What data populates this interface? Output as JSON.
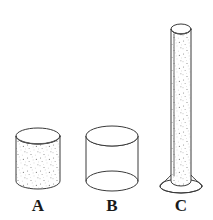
{
  "figure": {
    "background_color": "#ffffff",
    "line_color": "#3a3a3a",
    "label_color": "#1a1a1a",
    "fill_speckle_color": "#9a9a9a"
  },
  "objects": [
    {
      "id": "cylinder-a",
      "label": "A",
      "fill_state": "filled",
      "shape": "short-wide-cylinder",
      "label_x": 38,
      "label_y": 211,
      "geom": {
        "cx": 38,
        "top_cy": 136,
        "bottom_cy": 181,
        "rx": 22,
        "ry": 8
      }
    },
    {
      "id": "cylinder-b",
      "label": "B",
      "fill_state": "empty",
      "shape": "short-wide-cylinder",
      "label_x": 112,
      "label_y": 211,
      "geom": {
        "cx": 112,
        "top_cy": 136,
        "bottom_cy": 181,
        "rx": 26,
        "ry": 10
      }
    },
    {
      "id": "cylinder-c",
      "label": "C",
      "fill_state": "filled",
      "shape": "tall-narrow-cylinder-with-foot",
      "label_x": 181,
      "label_y": 211,
      "geom": {
        "cx": 181,
        "top_cy": 29,
        "bottom_cy": 184,
        "rx": 10,
        "ry": 5,
        "foot_rx": 21,
        "foot_ry": 7,
        "foot_cy": 186
      }
    }
  ],
  "labels": {
    "a": "A",
    "b": "B",
    "c": "C"
  }
}
